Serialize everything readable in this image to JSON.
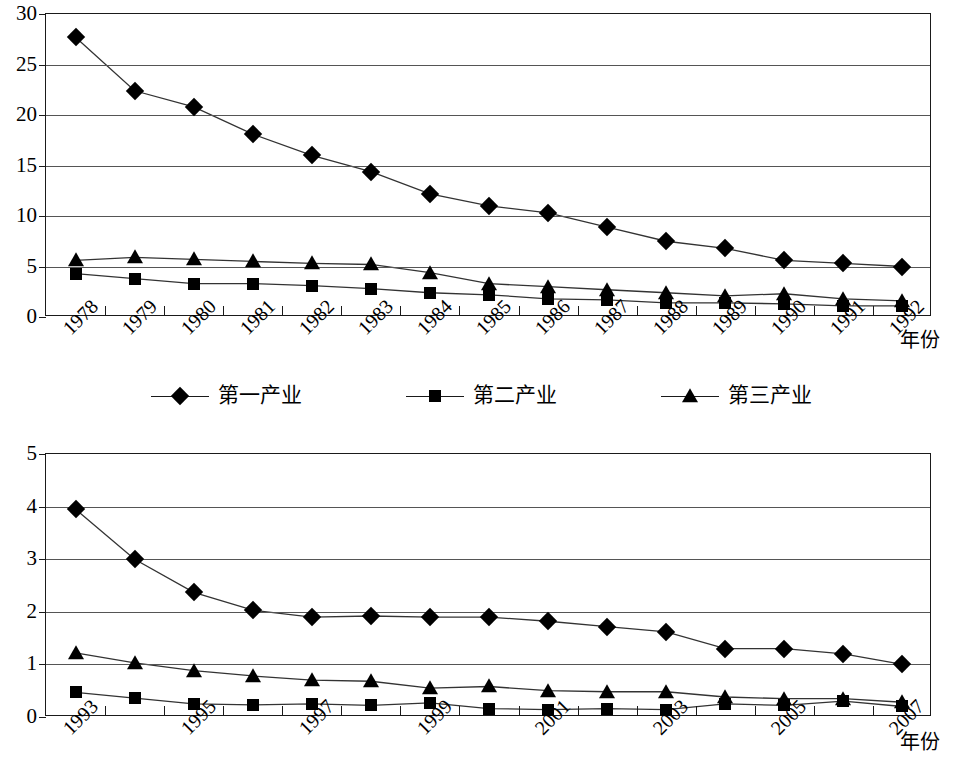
{
  "charts": [
    {
      "id": "chart-1978-1992",
      "axis_title": "年份",
      "ylim": [
        0,
        30
      ],
      "yticks": [
        "0",
        "5",
        "10",
        "15",
        "20",
        "25",
        "30"
      ],
      "categories": [
        "1978",
        "1979",
        "1980",
        "1981",
        "1982",
        "1983",
        "1984",
        "1985",
        "1986",
        "1987",
        "1988",
        "1989",
        "1990",
        "1991",
        "1992"
      ],
      "tick_labels": [
        "1978",
        "1979",
        "1980",
        "1981",
        "1982",
        "1983",
        "1984",
        "1985",
        "1986",
        "1987",
        "1988",
        "1989",
        "1990",
        "1991",
        "1992"
      ],
      "series": [
        {
          "name": "第一产业",
          "marker": "diamond",
          "values": [
            27.7,
            22.4,
            20.8,
            18.1,
            16.0,
            14.4,
            12.2,
            11.0,
            10.3,
            8.9,
            7.5,
            6.8,
            5.6,
            5.3,
            5.0
          ]
        },
        {
          "name": "第二产业",
          "marker": "square",
          "values": [
            4.3,
            3.8,
            3.3,
            3.3,
            3.1,
            2.8,
            2.4,
            2.2,
            1.8,
            1.7,
            1.4,
            1.4,
            1.3,
            1.1,
            1.1
          ]
        },
        {
          "name": "第三产业",
          "marker": "triangle",
          "values": [
            5.6,
            5.9,
            5.7,
            5.5,
            5.3,
            5.2,
            4.4,
            3.3,
            3.0,
            2.7,
            2.4,
            2.1,
            2.3,
            1.8,
            1.6
          ]
        }
      ],
      "legend": [
        "第一产业",
        "第二产业",
        "第三产业"
      ]
    },
    {
      "id": "chart-1993-2007",
      "axis_title": "年份",
      "ylim": [
        0,
        5
      ],
      "yticks": [
        "0",
        "1",
        "2",
        "3",
        "4",
        "5"
      ],
      "categories": [
        "1993",
        "1994",
        "1995",
        "1996",
        "1997",
        "1998",
        "1999",
        "2000",
        "2001",
        "2002",
        "2003",
        "2004",
        "2005",
        "2006",
        "2007"
      ],
      "tick_labels": [
        "1993",
        "",
        "1995",
        "",
        "1997",
        "",
        "1999",
        "",
        "2001",
        "",
        "2003",
        "",
        "2005",
        "",
        "2007"
      ],
      "series": [
        {
          "name": "第一产业",
          "marker": "diamond",
          "values": [
            3.95,
            3.0,
            2.37,
            2.03,
            1.9,
            1.92,
            1.9,
            1.9,
            1.82,
            1.72,
            1.62,
            1.3,
            1.3,
            1.2,
            1.0
          ]
        },
        {
          "name": "第二产业",
          "marker": "square",
          "values": [
            0.47,
            0.36,
            0.25,
            0.23,
            0.25,
            0.22,
            0.27,
            0.16,
            0.14,
            0.16,
            0.14,
            0.25,
            0.22,
            0.3,
            0.2
          ]
        },
        {
          "name": "第三产业",
          "marker": "triangle",
          "values": [
            1.22,
            1.03,
            0.88,
            0.78,
            0.7,
            0.68,
            0.55,
            0.58,
            0.5,
            0.48,
            0.48,
            0.38,
            0.35,
            0.35,
            0.28
          ]
        }
      ],
      "legend": [
        "第一产业",
        "第二产业",
        "第三产业"
      ]
    }
  ],
  "chart_data": [
    {
      "type": "line",
      "title": "",
      "xlabel": "年份",
      "ylabel": "",
      "ylim": [
        0,
        30
      ],
      "grid": true,
      "legend_position": "bottom",
      "categories": [
        "1978",
        "1979",
        "1980",
        "1981",
        "1982",
        "1983",
        "1984",
        "1985",
        "1986",
        "1987",
        "1988",
        "1989",
        "1990",
        "1991",
        "1992"
      ],
      "series": [
        {
          "name": "第一产业",
          "values": [
            27.7,
            22.4,
            20.8,
            18.1,
            16.0,
            14.4,
            12.2,
            11.0,
            10.3,
            8.9,
            7.5,
            6.8,
            5.6,
            5.3,
            5.0
          ]
        },
        {
          "name": "第二产业",
          "values": [
            4.3,
            3.8,
            3.3,
            3.3,
            3.1,
            2.8,
            2.4,
            2.2,
            1.8,
            1.7,
            1.4,
            1.4,
            1.3,
            1.1,
            1.1
          ]
        },
        {
          "name": "第三产业",
          "values": [
            5.6,
            5.9,
            5.7,
            5.5,
            5.3,
            5.2,
            4.4,
            3.3,
            3.0,
            2.7,
            2.4,
            2.1,
            2.3,
            1.8,
            1.6
          ]
        }
      ]
    },
    {
      "type": "line",
      "title": "",
      "xlabel": "年份",
      "ylabel": "",
      "ylim": [
        0,
        5
      ],
      "grid": true,
      "legend_position": "bottom",
      "categories": [
        "1993",
        "1994",
        "1995",
        "1996",
        "1997",
        "1998",
        "1999",
        "2000",
        "2001",
        "2002",
        "2003",
        "2004",
        "2005",
        "2006",
        "2007"
      ],
      "series": [
        {
          "name": "第一产业",
          "values": [
            3.95,
            3.0,
            2.37,
            2.03,
            1.9,
            1.92,
            1.9,
            1.9,
            1.82,
            1.72,
            1.62,
            1.3,
            1.3,
            1.2,
            1.0
          ]
        },
        {
          "name": "第二产业",
          "values": [
            0.47,
            0.36,
            0.25,
            0.23,
            0.25,
            0.22,
            0.27,
            0.16,
            0.14,
            0.16,
            0.14,
            0.25,
            0.22,
            0.3,
            0.2
          ]
        },
        {
          "name": "第三产业",
          "values": [
            1.22,
            1.03,
            0.88,
            0.78,
            0.7,
            0.68,
            0.55,
            0.58,
            0.5,
            0.48,
            0.48,
            0.38,
            0.35,
            0.35,
            0.28
          ]
        }
      ]
    }
  ]
}
